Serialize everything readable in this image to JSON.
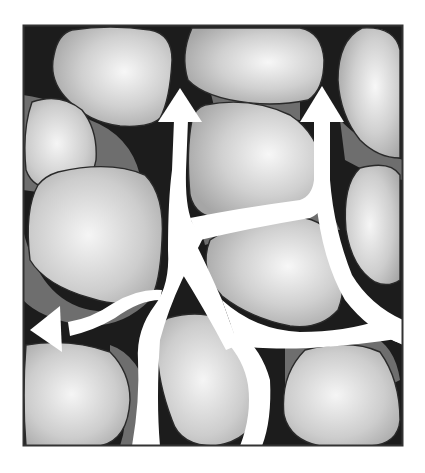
{
  "diagram": {
    "title": "",
    "description": "Cross-section of packed grains with pore spaces; white channels with arrows show fluid flow pathways through connected pores",
    "colors": {
      "pore_background": "#1c1c1c",
      "grain_fill_light": "#f2f2f2",
      "grain_fill_dark": "#a9a9a9",
      "grain_outline": "#2a2a2a",
      "water_film": "#6e6e6e",
      "flow_channel": "#ffffff",
      "frame": "#333333"
    },
    "frame": {
      "x": 23,
      "y": 25,
      "width": 380,
      "height": 421
    },
    "grains": [
      {
        "id": "grain-top-left"
      },
      {
        "id": "grain-top-center"
      },
      {
        "id": "grain-top-right"
      },
      {
        "id": "grain-left-upper"
      },
      {
        "id": "grain-left-middle"
      },
      {
        "id": "grain-center-upper"
      },
      {
        "id": "grain-right-middle"
      },
      {
        "id": "grain-center"
      },
      {
        "id": "grain-bottom-left"
      },
      {
        "id": "grain-bottom-center"
      },
      {
        "id": "grain-bottom-right"
      }
    ],
    "arrows": [
      {
        "id": "arrow-up-left",
        "direction": "up"
      },
      {
        "id": "arrow-up-right",
        "direction": "up"
      },
      {
        "id": "arrow-left",
        "direction": "left"
      }
    ],
    "labels": []
  }
}
